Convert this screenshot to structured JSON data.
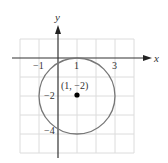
{
  "figure": {
    "axes": {
      "x_label": "x",
      "y_label": "y"
    },
    "ticks": {
      "x": [
        {
          "value": -1,
          "label": "−1"
        },
        {
          "value": 1,
          "label": "1"
        },
        {
          "value": 3,
          "label": "3"
        }
      ],
      "y": [
        {
          "value": -2,
          "label": "−2"
        },
        {
          "value": -4,
          "label": "−4"
        }
      ]
    },
    "circle": {
      "center": [
        1,
        -2
      ],
      "radius": 2
    },
    "point": {
      "label": "(1, −2)",
      "x": 1,
      "y": -2
    },
    "grid": {
      "x_range": [
        -2,
        4
      ],
      "y_range": [
        -5,
        1
      ]
    },
    "colors": {
      "grid": "#d9d9d9",
      "axis": "#333333",
      "circle": "#777777",
      "point": "#000000"
    }
  }
}
